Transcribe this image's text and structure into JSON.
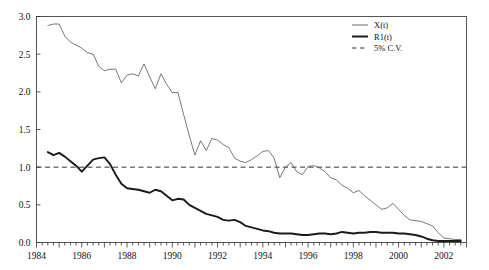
{
  "chart_data": {
    "type": "line",
    "title": "",
    "xlabel": "",
    "ylabel": "",
    "xlim": [
      1984.0,
      2003.0
    ],
    "ylim": [
      0.0,
      3.0
    ],
    "grid": false,
    "legend_position": "top-right",
    "yticks": [
      "0.0",
      "0.5",
      "1.0",
      "1.5",
      "2.0",
      "2.5",
      "3.0"
    ],
    "ytick_values": [
      0.0,
      0.5,
      1.0,
      1.5,
      2.0,
      2.5,
      3.0
    ],
    "xticks": [
      "1984",
      "1986",
      "1988",
      "1990",
      "1992",
      "1994",
      "1996",
      "1998",
      "2000",
      "2002"
    ],
    "xtick_values": [
      1984,
      1986,
      1988,
      1990,
      1992,
      1994,
      1996,
      1998,
      2000,
      2002
    ],
    "minor_tick_interval": 0.25,
    "annotations": [],
    "series": [
      {
        "name": "X(t)",
        "style": "thin-solid",
        "color": "#555555",
        "width": 0.8,
        "x": [
          1984.5,
          1984.75,
          1985.0,
          1985.25,
          1985.5,
          1985.75,
          1986.0,
          1986.25,
          1986.5,
          1986.75,
          1987.0,
          1987.25,
          1987.5,
          1987.75,
          1988.0,
          1988.25,
          1988.5,
          1988.75,
          1989.0,
          1989.25,
          1989.5,
          1989.75,
          1990.0,
          1990.25,
          1990.5,
          1990.75,
          1991.0,
          1991.25,
          1991.5,
          1991.75,
          1992.0,
          1992.25,
          1992.5,
          1992.75,
          1993.0,
          1993.25,
          1993.5,
          1993.75,
          1994.0,
          1994.25,
          1994.5,
          1994.75,
          1995.0,
          1995.25,
          1995.5,
          1995.75,
          1996.0,
          1996.25,
          1996.5,
          1996.75,
          1997.0,
          1997.25,
          1997.5,
          1997.75,
          1998.0,
          1998.25,
          1998.5,
          1998.75,
          1999.0,
          1999.25,
          1999.5,
          1999.75,
          2000.0,
          2000.25,
          2000.5,
          2000.75,
          2001.0,
          2001.25,
          2001.5,
          2001.75,
          2002.0,
          2002.25,
          2002.5,
          2002.75
        ],
        "y": [
          2.88,
          2.9,
          2.9,
          2.74,
          2.66,
          2.62,
          2.58,
          2.52,
          2.5,
          2.34,
          2.28,
          2.3,
          2.3,
          2.12,
          2.22,
          2.24,
          2.21,
          2.37,
          2.2,
          2.04,
          2.24,
          2.1,
          1.99,
          1.99,
          1.7,
          1.42,
          1.16,
          1.35,
          1.22,
          1.38,
          1.36,
          1.3,
          1.26,
          1.12,
          1.08,
          1.06,
          1.1,
          1.15,
          1.21,
          1.22,
          1.12,
          0.86,
          1.0,
          1.06,
          0.94,
          0.9,
          1.01,
          1.02,
          0.99,
          0.94,
          0.86,
          0.83,
          0.76,
          0.72,
          0.66,
          0.69,
          0.62,
          0.56,
          0.5,
          0.44,
          0.46,
          0.52,
          0.44,
          0.36,
          0.3,
          0.29,
          0.28,
          0.25,
          0.22,
          0.13,
          0.06,
          0.05,
          0.04,
          0.04
        ]
      },
      {
        "name": "R1(t)",
        "style": "thick-solid",
        "color": "#1a1a1a",
        "width": 1.9,
        "x": [
          1984.5,
          1984.75,
          1985.0,
          1985.25,
          1985.5,
          1985.75,
          1986.0,
          1986.25,
          1986.5,
          1986.75,
          1987.0,
          1987.25,
          1987.5,
          1987.75,
          1988.0,
          1988.25,
          1988.5,
          1988.75,
          1989.0,
          1989.25,
          1989.5,
          1989.75,
          1990.0,
          1990.25,
          1990.5,
          1990.75,
          1991.0,
          1991.25,
          1991.5,
          1991.75,
          1992.0,
          1992.25,
          1992.5,
          1992.75,
          1993.0,
          1993.25,
          1993.5,
          1993.75,
          1994.0,
          1994.25,
          1994.5,
          1994.75,
          1995.0,
          1995.25,
          1995.5,
          1995.75,
          1996.0,
          1996.25,
          1996.5,
          1996.75,
          1997.0,
          1997.25,
          1997.5,
          1997.75,
          1998.0,
          1998.25,
          1998.5,
          1998.75,
          1999.0,
          1999.25,
          1999.5,
          1999.75,
          2000.0,
          2000.25,
          2000.5,
          2000.75,
          2001.0,
          2001.25,
          2001.5,
          2001.75,
          2002.0,
          2002.25,
          2002.5,
          2002.75
        ],
        "y": [
          1.2,
          1.16,
          1.19,
          1.14,
          1.08,
          1.02,
          0.94,
          1.02,
          1.1,
          1.12,
          1.13,
          1.04,
          0.9,
          0.78,
          0.72,
          0.71,
          0.7,
          0.68,
          0.66,
          0.7,
          0.68,
          0.62,
          0.56,
          0.58,
          0.57,
          0.5,
          0.46,
          0.42,
          0.38,
          0.36,
          0.34,
          0.3,
          0.29,
          0.3,
          0.27,
          0.22,
          0.2,
          0.18,
          0.16,
          0.15,
          0.13,
          0.12,
          0.12,
          0.12,
          0.11,
          0.1,
          0.1,
          0.11,
          0.12,
          0.12,
          0.11,
          0.12,
          0.14,
          0.13,
          0.12,
          0.13,
          0.13,
          0.14,
          0.14,
          0.13,
          0.13,
          0.13,
          0.12,
          0.12,
          0.11,
          0.1,
          0.08,
          0.05,
          0.03,
          0.02,
          0.02,
          0.02,
          0.02,
          0.02
        ]
      }
    ],
    "reference_lines": [
      {
        "name": "5% C.V.",
        "value": 1.0,
        "orientation": "horizontal",
        "style": "dashed",
        "color": "#333333"
      }
    ],
    "legend": [
      {
        "label": "X(t)",
        "style": "thin-solid"
      },
      {
        "label": "R1(t)",
        "style": "thick-solid"
      },
      {
        "label": "5% C.V.",
        "style": "dashed"
      }
    ]
  }
}
